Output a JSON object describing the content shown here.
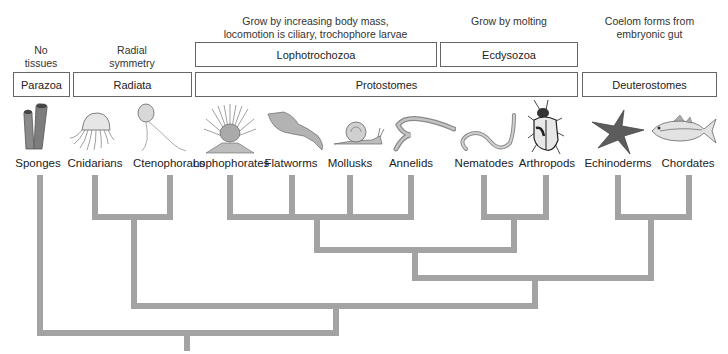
{
  "descriptors": {
    "no_tissues": "No\ntissues",
    "radial_symmetry": "Radial\nsymmetry",
    "lophotrochozoa_traits": "Grow by increasing body mass,\nlocomotion is ciliary, trochophore larvae",
    "ecdysozoa_traits": "Grow by molting",
    "deuterostome_traits": "Coelom forms from\nembryonic gut"
  },
  "groups": {
    "parazoa": "Parazoa",
    "radiata": "Radiata",
    "lophotrochozoa": "Lophotrochozoa",
    "ecdysozoa": "Ecdysozoa",
    "protostomes": "Protostomes",
    "deuterostomes": "Deuterostomes"
  },
  "taxa": [
    {
      "label": "Sponges",
      "icon": "sponge-icon"
    },
    {
      "label": "Cnidarians",
      "icon": "jellyfish-icon"
    },
    {
      "label": "Ctenophorans",
      "icon": "comb-jelly-icon"
    },
    {
      "label": "Lophophorates",
      "icon": "lophophorate-icon"
    },
    {
      "label": "Flatworms",
      "icon": "flatworm-icon"
    },
    {
      "label": "Mollusks",
      "icon": "snail-icon"
    },
    {
      "label": "Annelids",
      "icon": "segmented-worm-icon"
    },
    {
      "label": "Nematodes",
      "icon": "roundworm-icon"
    },
    {
      "label": "Arthropods",
      "icon": "beetle-icon"
    },
    {
      "label": "Echinoderms",
      "icon": "starfish-icon"
    },
    {
      "label": "Chordates",
      "icon": "fish-icon"
    }
  ],
  "colors": {
    "tree_line": "#a3a3a3",
    "box_border": "#666666"
  }
}
